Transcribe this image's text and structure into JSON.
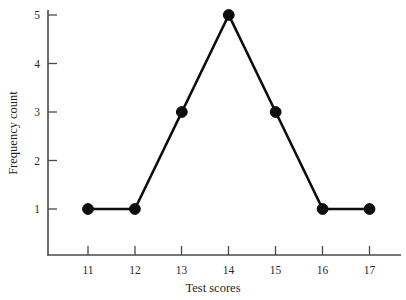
{
  "chart_data": {
    "type": "line",
    "title": "",
    "xlabel": "Test scores",
    "ylabel": "Frequency count",
    "x": [
      11,
      12,
      13,
      14,
      15,
      16,
      17
    ],
    "values": [
      1,
      1,
      3,
      5,
      3,
      1,
      1
    ],
    "xticklabels": [
      "11",
      "12",
      "13",
      "14",
      "15",
      "16",
      "17"
    ],
    "yticklabels": [
      "1",
      "2",
      "3",
      "4",
      "5"
    ],
    "yticks": [
      1,
      2,
      3,
      4,
      5
    ],
    "xlim": [
      10.55,
      17.65
    ],
    "ylim": [
      0,
      5.3
    ],
    "grid": false,
    "legend": null,
    "marker": "filled-circle",
    "line_color": "#0d0d0d",
    "marker_color": "#0d0d0d",
    "axis_color": "#4a4a4a",
    "background": "#ffffff"
  },
  "labels": {
    "x_axis_title": "Test scores",
    "y_axis_title": "Frequency count",
    "x_ticks": [
      "11",
      "12",
      "13",
      "14",
      "15",
      "16",
      "17"
    ],
    "y_ticks": [
      "1",
      "2",
      "3",
      "4",
      "5"
    ]
  }
}
